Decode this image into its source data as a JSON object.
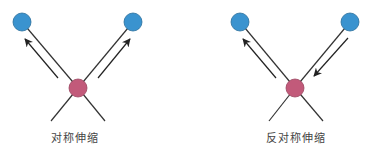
{
  "colors": {
    "outer_atom": "#3a93cf",
    "outer_atom_stroke": "#2a6f9c",
    "center_atom": "#c25a7a",
    "center_atom_stroke": "#9a4560",
    "bond": "#333333",
    "arrow": "#222222"
  },
  "panels": [
    {
      "label": "对称伸缩",
      "label_x": 75,
      "center": {
        "x": 78,
        "y": 88
      },
      "outer_atoms": [
        {
          "x": 22,
          "y": 22
        },
        {
          "x": 133,
          "y": 22
        }
      ],
      "lower_bonds": [
        {
          "x": 51,
          "y": 121
        },
        {
          "x": 105,
          "y": 121
        }
      ],
      "arrows": [
        {
          "from": {
            "x": 58,
            "y": 78
          },
          "to": {
            "x": 25,
            "y": 39
          },
          "direction": "outward"
        },
        {
          "from": {
            "x": 98,
            "y": 78
          },
          "to": {
            "x": 130,
            "y": 39
          },
          "direction": "outward"
        }
      ]
    },
    {
      "label": "反对称伸缩",
      "label_x": 296,
      "center": {
        "x": 295,
        "y": 88
      },
      "outer_atoms": [
        {
          "x": 240,
          "y": 22
        },
        {
          "x": 350,
          "y": 22
        }
      ],
      "lower_bonds": [
        {
          "x": 269,
          "y": 121
        },
        {
          "x": 323,
          "y": 121
        }
      ],
      "arrows": [
        {
          "from": {
            "x": 276,
            "y": 78
          },
          "to": {
            "x": 243,
            "y": 39
          },
          "direction": "outward"
        },
        {
          "from": {
            "x": 348,
            "y": 38
          },
          "to": {
            "x": 314,
            "y": 76
          },
          "direction": "inward"
        }
      ]
    }
  ]
}
